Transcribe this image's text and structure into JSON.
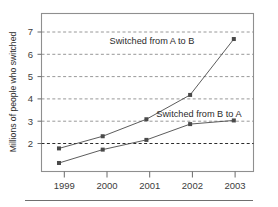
{
  "chart_data": {
    "type": "line",
    "title": "",
    "subtitle": "",
    "xlabel": "",
    "ylabel": "Millions of people who switched",
    "categories": [
      "1999",
      "2000",
      "2001",
      "2002",
      "2003"
    ],
    "x": [
      1999,
      2000,
      2001,
      2002,
      2003
    ],
    "series": [
      {
        "name": "Switched from A to B",
        "values": [
          2.0,
          2.5,
          3.2,
          4.2,
          6.5
        ],
        "color": "#4a4a4a",
        "marker": "square"
      },
      {
        "name": "Switched from B to A",
        "values": [
          1.4,
          1.95,
          2.35,
          3.0,
          3.15
        ],
        "color": "#4a4a4a",
        "marker": "square"
      }
    ],
    "ylim": [
      1.05,
      7.55
    ],
    "xlim": [
      1998.6,
      2003.45
    ],
    "yticks": [
      2,
      3,
      4,
      5,
      6,
      7
    ],
    "ytick_labels": [
      "2",
      "3",
      "4",
      "5",
      "6",
      "7"
    ],
    "xtick_labels": [
      "1999",
      "2000",
      "2001",
      "2002",
      "2003"
    ],
    "grid": true,
    "grid_axis": "y",
    "grid_style": "dashed",
    "grid_color": "#8c8c8c",
    "legend": "none",
    "annotations": [
      {
        "text": "Switched from A to B",
        "series": "Switched from A to B",
        "x": 2001.55,
        "y": 6.55
      },
      {
        "text": "Switched from B to A",
        "series": "Switched from B to A",
        "x": 2001.9,
        "y": 3.4
      }
    ],
    "frame_color": "#8f8f8f",
    "background": "#ffffff"
  },
  "figure": {
    "y_axis_title": "Millions of people who switched",
    "ytick_2": "2",
    "ytick_3": "3",
    "ytick_4": "4",
    "ytick_5": "5",
    "ytick_6": "6",
    "ytick_7": "7",
    "xtick_1999": "1999",
    "xtick_2000": "2000",
    "xtick_2001": "2001",
    "xtick_2002": "2002",
    "xtick_2003": "2003",
    "annotation_a_to_b": "Switched from A to B",
    "annotation_b_to_a": "Switched from B to A"
  }
}
